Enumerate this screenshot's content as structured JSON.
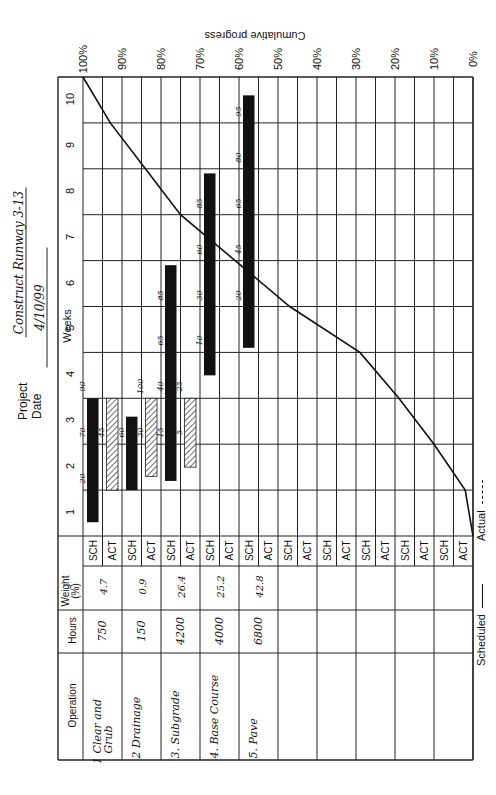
{
  "header": {
    "project_label": "Project",
    "project_value": "Construct Runway 3-13",
    "date_label": "Date",
    "date_value": "4/10/99"
  },
  "table": {
    "headers": {
      "operation": "Operation",
      "hours": "Hours",
      "weight": "Weight (%)",
      "weight_line1": "Weight",
      "weight_line2": "(%)"
    },
    "row_labels": {
      "sch": "SCH",
      "act": "ACT"
    },
    "operations": [
      {
        "name": "1 Clear and Grub",
        "name_line1": "1 Clear and",
        "name_line2": "Grub",
        "hours": "750",
        "weight": "4.7"
      },
      {
        "name": "2 Drainage",
        "name_line1": "2 Drainage",
        "name_line2": "",
        "hours": "150",
        "weight": "0.9"
      },
      {
        "name": "3. Subgrade",
        "name_line1": "3. Subgrade",
        "name_line2": "",
        "hours": "4200",
        "weight": "26.4"
      },
      {
        "name": "4. Base Course",
        "name_line1": "4. Base Course",
        "name_line2": "",
        "hours": "4000",
        "weight": "25.2"
      },
      {
        "name": "5. Pave",
        "name_line1": "5. Pave",
        "name_line2": "",
        "hours": "6800",
        "weight": "42.8"
      },
      {
        "name": "",
        "name_line1": "",
        "name_line2": "",
        "hours": "",
        "weight": ""
      },
      {
        "name": "",
        "name_line1": "",
        "name_line2": "",
        "hours": "",
        "weight": ""
      },
      {
        "name": "",
        "name_line1": "",
        "name_line2": "",
        "hours": "",
        "weight": ""
      },
      {
        "name": "",
        "name_line1": "",
        "name_line2": "",
        "hours": "",
        "weight": ""
      },
      {
        "name": "",
        "name_line1": "",
        "name_line2": "",
        "hours": "",
        "weight": ""
      }
    ]
  },
  "axes": {
    "weeks_label": "Weeks",
    "week_ticks": [
      "1",
      "2",
      "3",
      "4",
      "5",
      "6",
      "7",
      "8",
      "9",
      "10"
    ],
    "progress_label": "Cumulative progress",
    "progress_ticks": [
      "100%",
      "90%",
      "80%",
      "70%",
      "60%",
      "50%",
      "40%",
      "30%",
      "20%",
      "10%",
      "0%"
    ]
  },
  "legend": {
    "scheduled_label": "Scheduled",
    "actual_label": "Actual"
  },
  "chart_data": {
    "type": "gantt_with_s_curve",
    "date": "4/10/99",
    "xlabel": "Weeks",
    "ylabel": "Cumulative progress",
    "x_range": [
      0,
      10
    ],
    "y_range": [
      0,
      100
    ],
    "orientation_note": "page printed rotated 90 degrees counter-clockwise",
    "tasks": [
      {
        "operation": "1 Clear and Grub",
        "hours": 750,
        "weight_pct": 4.7,
        "scheduled": {
          "start_week": 0.3,
          "end_week": 3.0,
          "pct_marks": [
            {
              "week": 1,
              "pct": 20
            },
            {
              "week": 2,
              "pct": 70
            },
            {
              "week": 3,
              "pct": 90
            }
          ]
        },
        "actual": {
          "start_week": 1.0,
          "end_week": 3.0,
          "pct_marks": [
            {
              "week": 2,
              "pct": 45
            }
          ]
        }
      },
      {
        "operation": "2 Drainage",
        "hours": 150,
        "weight_pct": 0.9,
        "scheduled": {
          "start_week": 1.0,
          "end_week": 2.6,
          "pct_marks": [
            {
              "week": 2,
              "pct": 60
            }
          ]
        },
        "actual": {
          "start_week": 1.3,
          "end_week": 3.0,
          "pct_marks": [
            {
              "week": 2,
              "pct": 30
            },
            {
              "week": 3,
              "pct": 100
            }
          ]
        }
      },
      {
        "operation": "3. Subgrade",
        "hours": 4200,
        "weight_pct": 26.4,
        "scheduled": {
          "start_week": 1.2,
          "end_week": 5.9,
          "pct_marks": [
            {
              "week": 2,
              "pct": 15
            },
            {
              "week": 3,
              "pct": 40
            },
            {
              "week": 4,
              "pct": 65
            },
            {
              "week": 5,
              "pct": 85
            }
          ]
        },
        "actual": {
          "start_week": 1.5,
          "end_week": 3.0,
          "pct_marks": [
            {
              "week": 2,
              "pct": 5
            },
            {
              "week": 3,
              "pct": 25
            }
          ]
        }
      },
      {
        "operation": "4. Base Course",
        "hours": 4000,
        "weight_pct": 25.2,
        "scheduled": {
          "start_week": 3.5,
          "end_week": 7.9,
          "pct_marks": [
            {
              "week": 4,
              "pct": 10
            },
            {
              "week": 5,
              "pct": 30
            },
            {
              "week": 6,
              "pct": 60
            },
            {
              "week": 7,
              "pct": 85
            }
          ]
        },
        "actual": null
      },
      {
        "operation": "5. Pave",
        "hours": 6800,
        "weight_pct": 42.8,
        "scheduled": {
          "start_week": 4.1,
          "end_week": 9.6,
          "pct_marks": [
            {
              "week": 5,
              "pct": 20
            },
            {
              "week": 6,
              "pct": 45
            },
            {
              "week": 7,
              "pct": 65
            },
            {
              "week": 8,
              "pct": 80
            },
            {
              "week": 9,
              "pct": 95
            }
          ]
        },
        "actual": null
      }
    ],
    "series": [
      {
        "name": "Scheduled",
        "style": "solid",
        "x": [
          0,
          1,
          2,
          3,
          4,
          5,
          6,
          7,
          8,
          9,
          10
        ],
        "values": [
          0,
          2,
          10,
          19,
          29,
          47,
          61,
          75,
          84,
          93,
          100
        ]
      },
      {
        "name": "Actual",
        "style": "dashed",
        "x": [],
        "values": []
      }
    ],
    "grid": true,
    "legend_position": "bottom"
  }
}
